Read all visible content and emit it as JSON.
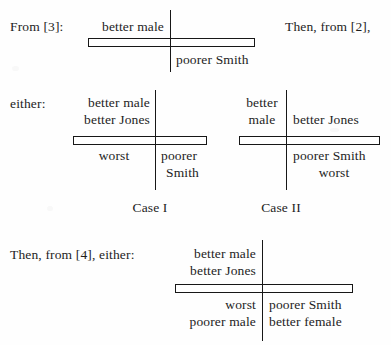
{
  "page": {
    "clipped_header": "Cross  diagrams",
    "width": 391,
    "height": 345,
    "ink_color": "#171717",
    "paper_color": "#fefefe"
  },
  "figure1": {
    "lead_label": "From [3]:",
    "side_note": "Then, from [2],",
    "upper_left": "better male",
    "lower_right": "poorer Smith"
  },
  "cases": {
    "lead_label": "either:",
    "case1": {
      "caption": "Case I",
      "upper_left_line1": "better male",
      "upper_left_line2": "better Jones",
      "lower_left": "worst",
      "lower_right_line1": "poorer",
      "lower_right_line2": "Smith"
    },
    "case2": {
      "caption": "Case II",
      "upper_left_line1": "better",
      "upper_left_line2": "male",
      "upper_right": "better Jones",
      "lower_right_line1": "poorer Smith",
      "lower_right_line2": "worst"
    }
  },
  "figure4": {
    "lead_label": "Then, from [4], either:",
    "upper_left_line1": "better male",
    "upper_left_line2": "better Jones",
    "lower_left_line1": "worst",
    "lower_left_line2": "poorer male",
    "lower_right_line1": "poorer Smith",
    "lower_right_line2": "better female"
  }
}
